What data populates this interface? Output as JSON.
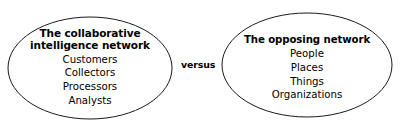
{
  "diagram": {
    "type": "venn-style-comparison",
    "background_color": "#ffffff",
    "stroke_color": "#1a1a1a",
    "text_color": "#000000",
    "connector": {
      "label": "versus",
      "style": "bold"
    },
    "nodes": [
      {
        "id": "collaborative",
        "shape": "ellipse",
        "title_lines": [
          "The collaborative",
          "intelligence network"
        ],
        "title": "The collaborative intelligence network",
        "items": [
          "Customers",
          "Collectors",
          "Processors",
          "Analysts"
        ]
      },
      {
        "id": "opposing",
        "shape": "ellipse",
        "title_lines": [
          "The opposing network"
        ],
        "title": "The opposing network",
        "items": [
          "People",
          "Places",
          "Things",
          "Organizations"
        ]
      }
    ]
  }
}
